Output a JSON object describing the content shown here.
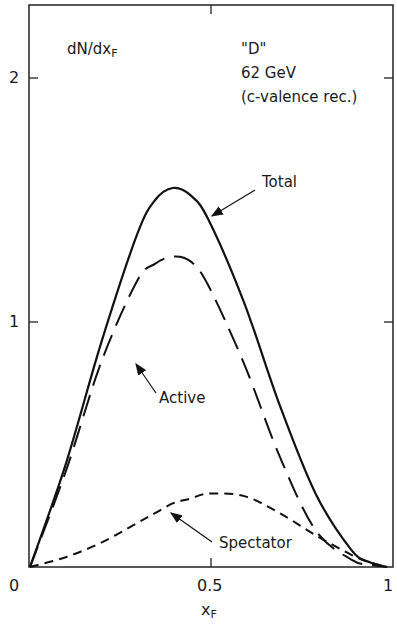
{
  "chart_data": {
    "type": "line",
    "title": "",
    "ylabel": "dN/dx_F",
    "xlabel": "x_F",
    "annotation": [
      "\"D\"",
      "62 GeV",
      "(c-valence rec.)"
    ],
    "xlim": [
      0,
      1
    ],
    "ylim": [
      0,
      2.25
    ],
    "xticks": [
      "0",
      "0.5",
      "1"
    ],
    "yticks": [
      "1",
      "2"
    ],
    "grid": false,
    "legend": "inline arrow labels",
    "x": [
      0,
      0.1,
      0.2,
      0.3,
      0.35,
      0.4,
      0.45,
      0.5,
      0.6,
      0.7,
      0.8,
      0.9,
      0.95,
      1.0
    ],
    "series": [
      {
        "name": "Total",
        "style": "solid",
        "values": [
          0,
          0.42,
          0.92,
          1.36,
          1.5,
          1.55,
          1.52,
          1.42,
          1.08,
          0.66,
          0.3,
          0.07,
          0.02,
          0
        ]
      },
      {
        "name": "Active",
        "style": "long-dash",
        "values": [
          0,
          0.39,
          0.84,
          1.17,
          1.24,
          1.27,
          1.25,
          1.15,
          0.83,
          0.45,
          0.15,
          0.03,
          0.01,
          0
        ]
      },
      {
        "name": "Spectator",
        "style": "short-dash",
        "values": [
          0,
          0.04,
          0.1,
          0.18,
          0.22,
          0.26,
          0.28,
          0.3,
          0.29,
          0.22,
          0.13,
          0.05,
          0.02,
          0
        ]
      }
    ]
  },
  "labels": {
    "ylabel_main": "dN/dx",
    "ylabel_sub": "F",
    "xlabel_main": "x",
    "xlabel_sub": "F",
    "ann1": "\"D\"",
    "ann2": "62 GeV",
    "ann3": "(c-valence rec.)",
    "total": "Total",
    "active": "Active",
    "spectator": "Spectator",
    "xt0": "0",
    "xt05": "0.5",
    "xt1": "1",
    "yt1": "1",
    "yt2": "2"
  }
}
